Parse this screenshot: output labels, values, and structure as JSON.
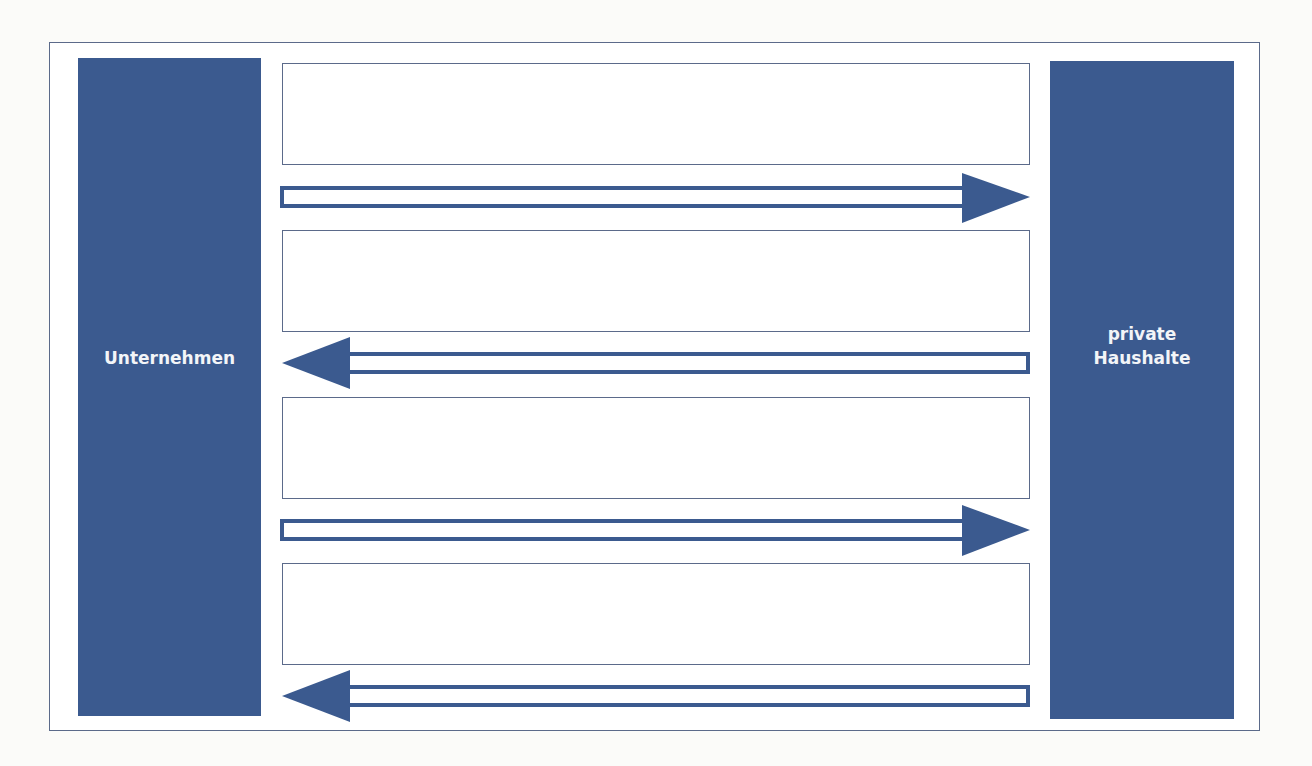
{
  "diagram": {
    "type": "circular-flow",
    "colors": {
      "sector_fill": "#3b5a8f",
      "sector_text": "#f3f5f8",
      "outline": "#5b6a8a",
      "arrow": "#3b5a8f",
      "background": "#ffffff"
    },
    "sectors": [
      {
        "id": "left",
        "label": "Unternehmen"
      },
      {
        "id": "right",
        "label": "private\nHaushalte"
      }
    ],
    "flows": [
      {
        "label_box": "",
        "arrow_direction": "right",
        "from": "Unternehmen",
        "to": "private Haushalte"
      },
      {
        "label_box": "",
        "arrow_direction": "left",
        "from": "private Haushalte",
        "to": "Unternehmen"
      },
      {
        "label_box": "",
        "arrow_direction": "right",
        "from": "Unternehmen",
        "to": "private Haushalte"
      },
      {
        "label_box": "",
        "arrow_direction": "left",
        "from": "private Haushalte",
        "to": "Unternehmen"
      }
    ]
  }
}
